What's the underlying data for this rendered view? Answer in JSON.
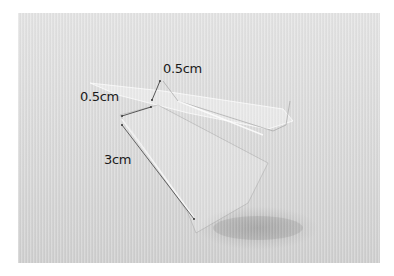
{
  "image": {
    "description": "Clear acrylic L-shaped bracket on light gray ribbed background with dimension annotations",
    "background_color": "#dcdcdc",
    "annotation_color": "#1a1a1a"
  },
  "annotations": [
    {
      "id": "top-lip",
      "text": "0.5cm"
    },
    {
      "id": "step",
      "text": "0.5cm"
    },
    {
      "id": "length",
      "text": "3cm"
    }
  ]
}
